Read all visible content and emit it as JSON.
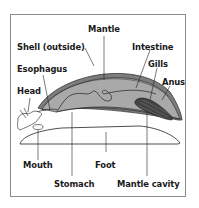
{
  "diagram": {
    "colors": {
      "frame": "#8a8a8a",
      "mantle_fill": "#a9a9a9",
      "shell_fill": "#7d7d7d",
      "gills_fill": "#444444",
      "outline": "#222222",
      "background": "#ffffff"
    },
    "labels": {
      "mantle": "Mantle",
      "shell": "Shell (outside)",
      "intestine": "Intestine",
      "esophagus": "Esophagus",
      "gills": "Gills",
      "anus": "Anus",
      "head": "Head",
      "mouth": "Mouth",
      "foot": "Foot",
      "stomach": "Stomach",
      "mantle_cavity": "Mantle cavity"
    }
  }
}
